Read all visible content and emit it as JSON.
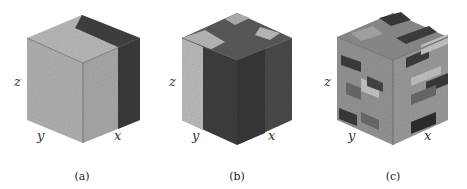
{
  "figure": {
    "panels": [
      {
        "id": "a",
        "caption": "(a)",
        "axes": {
          "x": "x",
          "y": "y",
          "z": "z"
        },
        "description": "Cube mostly light gray with dark band along x-face edge",
        "colors": {
          "light": "#b4b4b4",
          "mid": "#a0a0a0",
          "dark": "#3a3a3a"
        }
      },
      {
        "id": "b",
        "caption": "(b)",
        "axes": {
          "x": "x",
          "y": "y",
          "z": "z"
        },
        "description": "Cube with light gray band on y-face and dark regions elsewhere",
        "colors": {
          "light": "#bcbcbc",
          "mid": "#6a6a6a",
          "dark": "#333333"
        }
      },
      {
        "id": "c",
        "caption": "(c)",
        "axes": {
          "x": "x",
          "y": "y",
          "z": "z"
        },
        "description": "Cube with patchy multi-gray domains",
        "colors": {
          "light": "#c4c4c4",
          "mid": "#8a8a8a",
          "dark": "#3a3a3a"
        }
      }
    ]
  }
}
